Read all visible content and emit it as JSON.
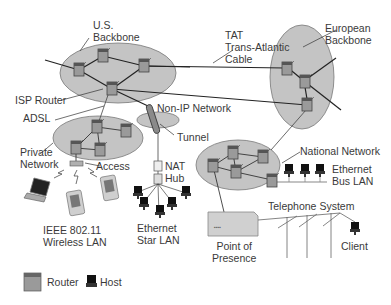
{
  "colors": {
    "cloud_fill": "#c4c4c4",
    "cloud_stroke": "#777777",
    "router_fill": "#9a9a9a",
    "line": "#222222",
    "text": "#3a3a3a"
  },
  "labels": {
    "us_backbone": [
      "U.S.",
      "Backbone"
    ],
    "tat": [
      "TAT",
      "Trans-Atlantic",
      "Cable"
    ],
    "european_backbone": [
      "European",
      "Backbone"
    ],
    "isp_router": "ISP Router",
    "adsl": "ADSL",
    "non_ip_network": "Non-IP Network",
    "tunnel": "Tunnel",
    "private_network": [
      "Private",
      "Network"
    ],
    "access": "Access",
    "nat": "NAT",
    "hub": "Hub",
    "national_network": "National Network",
    "ethernet_bus_lan": [
      "Ethernet",
      "Bus LAN"
    ],
    "wireless_lan": [
      "IEEE 802.11",
      "Wireless LAN"
    ],
    "ethernet_star_lan": [
      "Ethernet",
      "Star LAN"
    ],
    "telephone_system": "Telephone System",
    "point_of_presence": [
      "Point of",
      "Presence"
    ],
    "client": "Client"
  },
  "legend": [
    {
      "icon": "router-icon",
      "label": "Router"
    },
    {
      "icon": "host-icon",
      "label": "Host"
    }
  ]
}
